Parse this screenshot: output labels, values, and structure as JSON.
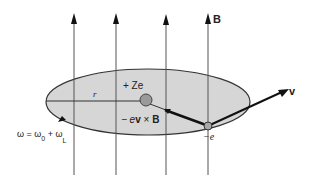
{
  "diagram": {
    "field_label": "B",
    "nucleus_label": "+ Ze",
    "force_label_prefix": "− e",
    "force_label_v": "v",
    "force_label_x": " × ",
    "force_label_B": "B",
    "radius_label": "r",
    "velocity_label": "v",
    "electron_label": "−e",
    "omega_label": "ω = ω",
    "omega_sub0": "0",
    "omega_plus": " + ω",
    "omega_subL": "L",
    "colors": {
      "ellipse_fill": "#d6d6d6",
      "line": "#333333",
      "field_line": "#555555",
      "nucleus_fill": "#9a9a9a",
      "electron_fill": "#a8a8a8"
    }
  }
}
